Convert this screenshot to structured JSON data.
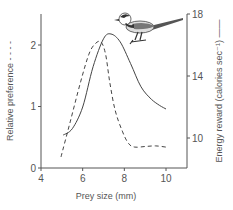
{
  "chart_data": {
    "type": "line",
    "title": "",
    "xlabel": "Prey size (mm)",
    "ylabel_left": "Relative preference - - - -",
    "ylabel_right": "Energy reward (calories sec⁻¹) ——",
    "xlim": [
      4,
      11
    ],
    "ylim_left": [
      0,
      2.5
    ],
    "ylim_right": [
      8,
      18
    ],
    "x_ticks": [
      4,
      6,
      8,
      10
    ],
    "y_left_ticks": [
      0,
      1,
      2
    ],
    "y_right_ticks": [
      10,
      14,
      18
    ],
    "grid": false,
    "series": [
      {
        "name": "Relative preference",
        "axis": "left",
        "style": "dashed",
        "x": [
          4.96,
          5.4,
          5.9,
          6.3,
          6.6,
          6.88,
          7.1,
          7.3,
          7.55,
          7.9,
          8.2,
          8.5,
          9.0,
          9.5,
          10.0
        ],
        "y": [
          0.18,
          0.75,
          1.4,
          1.85,
          2.02,
          2.05,
          1.85,
          1.4,
          0.95,
          0.6,
          0.4,
          0.34,
          0.35,
          0.36,
          0.34
        ]
      },
      {
        "name": "Energy reward",
        "axis": "right",
        "style": "solid",
        "x": [
          5.06,
          5.5,
          6.0,
          6.5,
          7.0,
          7.36,
          7.8,
          8.3,
          8.8,
          9.3,
          9.7,
          10.0
        ],
        "y": [
          10.19,
          10.6,
          12.0,
          14.6,
          16.4,
          16.71,
          16.2,
          14.8,
          13.3,
          12.5,
          12.1,
          11.87
        ]
      }
    ],
    "annotations": [
      "bird-illustration (wagtail)"
    ]
  }
}
